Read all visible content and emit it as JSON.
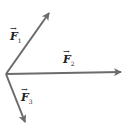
{
  "diagram": {
    "type": "vector-diagram",
    "colors": {
      "vector": "#6b6b6b",
      "text": "#222222",
      "background": "#ffffff"
    },
    "origin": {
      "x": 6,
      "y": 74
    },
    "vectors": [
      {
        "id": "F1",
        "label": "F",
        "subscript": "1",
        "tip": {
          "x": 49,
          "y": 13
        },
        "label_pos": {
          "x": 10,
          "y": 31
        }
      },
      {
        "id": "F2",
        "label": "F",
        "subscript": "2",
        "tip": {
          "x": 121,
          "y": 72
        },
        "label_pos": {
          "x": 63,
          "y": 54
        }
      },
      {
        "id": "F3",
        "label": "F",
        "subscript": "3",
        "tip": {
          "x": 25,
          "y": 122
        },
        "label_pos": {
          "x": 21,
          "y": 92
        }
      }
    ]
  }
}
